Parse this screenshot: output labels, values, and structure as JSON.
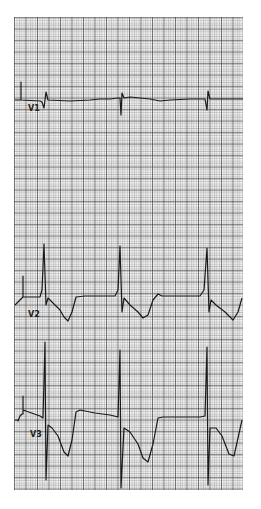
{
  "figure": {
    "type": "ecg-strip",
    "paper_color": "#ffffff",
    "grid_color": "#555555",
    "trace_color": "#1a1a1a",
    "grid": {
      "x0": 14,
      "y0": 17,
      "x1": 243,
      "y1": 490
    }
  },
  "leads": [
    {
      "id": "v1",
      "label": "V1",
      "label_x": 28,
      "label_y": 108,
      "baseline_y": 100
    },
    {
      "id": "v2",
      "label": "V2",
      "label_x": 28,
      "label_y": 314,
      "baseline_y": 297
    },
    {
      "id": "v3",
      "label": "V3",
      "label_x": 30,
      "label_y": 434,
      "baseline_y": 420
    }
  ]
}
